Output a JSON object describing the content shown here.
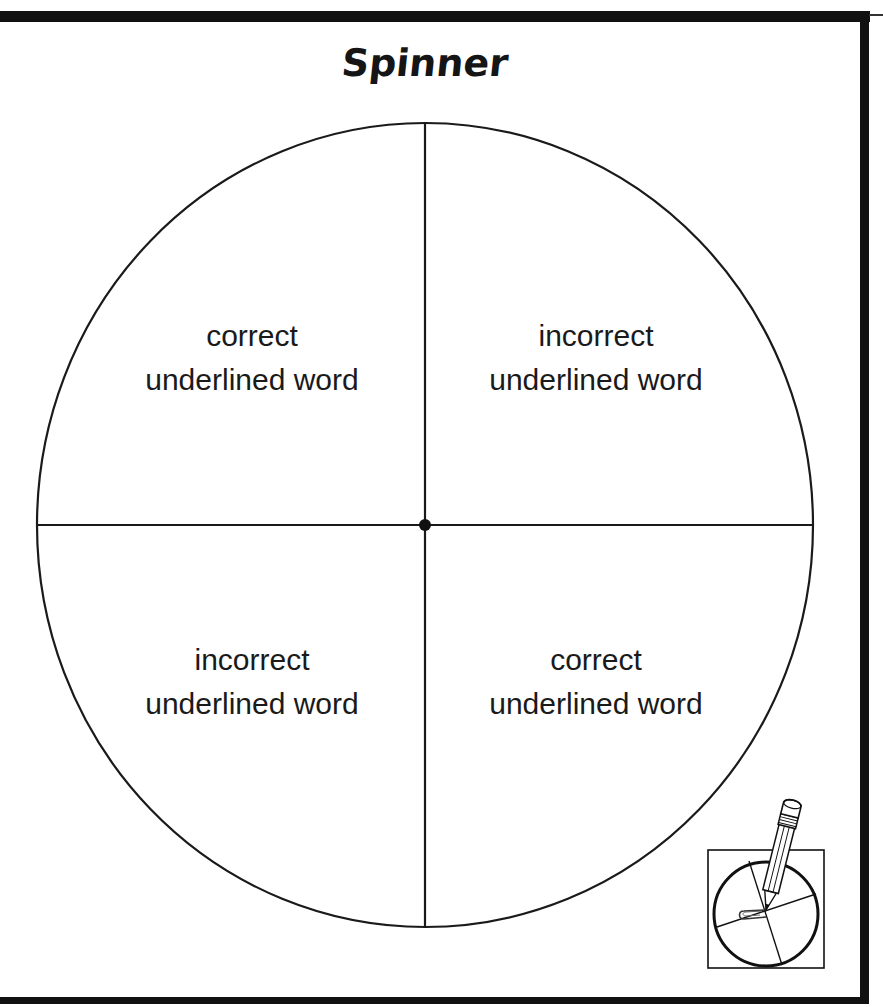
{
  "page": {
    "title": "Spinner"
  },
  "spinner": {
    "sections": [
      {
        "position": "top-left",
        "line1": "correct",
        "line2": "underlined word"
      },
      {
        "position": "top-right",
        "line1": "incorrect",
        "line2": "underlined word"
      },
      {
        "position": "bottom-left",
        "line1": "incorrect",
        "line2": "underlined word"
      },
      {
        "position": "bottom-right",
        "line1": "correct",
        "line2": "underlined word"
      }
    ],
    "center_pin": "center-dot",
    "line_color": "#1a1a1a"
  },
  "instruction_icon": {
    "name": "pencil-and-paperclip-spinner-icon",
    "description": "pencil holding a paperclip at the center of a small spinner"
  },
  "colors": {
    "ink": "#111111",
    "background": "#ffffff"
  }
}
